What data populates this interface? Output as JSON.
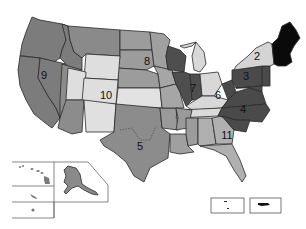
{
  "map": {
    "title": "",
    "colors": {
      "r1": "#0a0a0a",
      "r2": "#d4d4d4",
      "r3": "#4a4a4a",
      "r4": "#4a4a4a",
      "r5": "#8c8c8c",
      "r6": "#d8d8d8",
      "r7": "#4e4e4e",
      "r8": "#9c9c9c",
      "r9": "#7c7c7c",
      "r10": "#dedede",
      "r11": "#a8a8a8",
      "insets": "#8a8a8a"
    },
    "regions": [
      {
        "id": "1",
        "label": "1"
      },
      {
        "id": "2",
        "label": "2"
      },
      {
        "id": "3",
        "label": "3"
      },
      {
        "id": "4",
        "label": "4"
      },
      {
        "id": "5",
        "label": "5"
      },
      {
        "id": "6",
        "label": "6"
      },
      {
        "id": "7",
        "label": "7"
      },
      {
        "id": "8",
        "label": "8"
      },
      {
        "id": "9",
        "label": "9"
      },
      {
        "id": "10",
        "label": "10"
      },
      {
        "id": "11",
        "label": "11"
      }
    ],
    "insets": [
      "Hawaii",
      "Alaska",
      "Puerto Rico",
      "Virgin Islands"
    ]
  }
}
